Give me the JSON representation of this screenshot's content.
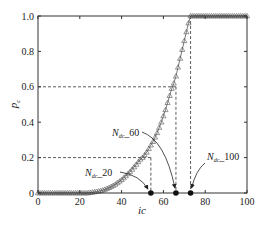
{
  "chart_data": {
    "type": "line",
    "title": "",
    "xlabel": "ic",
    "ylabel": "p",
    "ylabel_subscript": "c",
    "xlim": [
      0,
      100
    ],
    "ylim": [
      0,
      1.0
    ],
    "grid": false,
    "xticks": [
      0,
      20,
      40,
      60,
      80,
      100
    ],
    "xtick_labels": [
      "0",
      "20",
      "40",
      "60",
      "80",
      "100"
    ],
    "yticks": [
      0,
      0.2,
      0.4,
      0.6,
      0.8,
      1.0
    ],
    "ytick_labels": [
      "0",
      "0.2",
      "0.4",
      "0.6",
      "0.8",
      "1.0"
    ],
    "series": [
      {
        "name": "p_c",
        "marker": "triangle",
        "color": "#555555",
        "x": [
          0,
          1,
          2,
          3,
          4,
          5,
          6,
          7,
          8,
          9,
          10,
          11,
          12,
          13,
          14,
          15,
          16,
          17,
          18,
          19,
          20,
          21,
          22,
          23,
          24,
          25,
          26,
          27,
          28,
          29,
          30,
          31,
          32,
          33,
          34,
          35,
          36,
          37,
          38,
          39,
          40,
          41,
          42,
          43,
          44,
          45,
          46,
          47,
          48,
          49,
          50,
          51,
          52,
          53,
          54,
          55,
          56,
          57,
          58,
          59,
          60,
          61,
          62,
          63,
          64,
          65,
          66,
          67,
          68,
          69,
          70,
          71,
          72,
          73,
          74,
          75,
          76,
          77,
          78,
          79,
          80,
          81,
          82,
          83,
          84,
          85,
          86,
          87,
          88,
          89,
          90,
          91,
          92,
          93,
          94,
          95,
          96,
          97,
          98,
          99,
          100
        ],
        "y": [
          0,
          0,
          0,
          0,
          0,
          0,
          0,
          0,
          0,
          0,
          0,
          0,
          0,
          0,
          0,
          0,
          0,
          0,
          0,
          0,
          0,
          0,
          0,
          0,
          0,
          0.002,
          0.004,
          0.006,
          0.008,
          0.01,
          0.013,
          0.016,
          0.02,
          0.025,
          0.03,
          0.036,
          0.042,
          0.049,
          0.057,
          0.066,
          0.075,
          0.085,
          0.096,
          0.108,
          0.12,
          0.133,
          0.147,
          0.161,
          0.176,
          0.19,
          0.2,
          0.215,
          0.23,
          0.25,
          0.27,
          0.29,
          0.315,
          0.34,
          0.37,
          0.4,
          0.435,
          0.47,
          0.51,
          0.55,
          0.59,
          0.62,
          0.66,
          0.71,
          0.76,
          0.81,
          0.86,
          0.91,
          0.96,
          1.0,
          1.0,
          1.0,
          1.0,
          1.0,
          1.0,
          1.0,
          1.0,
          1.0,
          1.0,
          1.0,
          1.0,
          1.0,
          1.0,
          1.0,
          1.0,
          1.0,
          1.0,
          1.0,
          1.0,
          1.0,
          1.0,
          1.0,
          1.0,
          1.0,
          1.0,
          1.0,
          1.0
        ]
      }
    ],
    "reference_lines": [
      {
        "y": 0.2,
        "x": 54,
        "style": "dashed"
      },
      {
        "y": 0.6,
        "x": 66,
        "style": "dashed"
      },
      {
        "y": 1.0,
        "x": 73,
        "style": "dashed"
      }
    ],
    "key_points": [
      {
        "x": 54,
        "y": 0,
        "label": "N",
        "label_sub": "dc",
        "label_suffix": "_20"
      },
      {
        "x": 66,
        "y": 0,
        "label": "N",
        "label_sub": "dc",
        "label_suffix": "_60"
      },
      {
        "x": 73,
        "y": 0,
        "label": "N",
        "label_sub": "dc",
        "label_suffix": "_100"
      }
    ],
    "annotations": [
      {
        "text_main": "N",
        "text_sub": "dc",
        "text_suffix": "_20",
        "points_to": 0
      },
      {
        "text_main": "N",
        "text_sub": "dc",
        "text_suffix": "_60",
        "points_to": 1
      },
      {
        "text_main": "N",
        "text_sub": "dc",
        "text_suffix": "_100",
        "points_to": 2
      }
    ]
  }
}
